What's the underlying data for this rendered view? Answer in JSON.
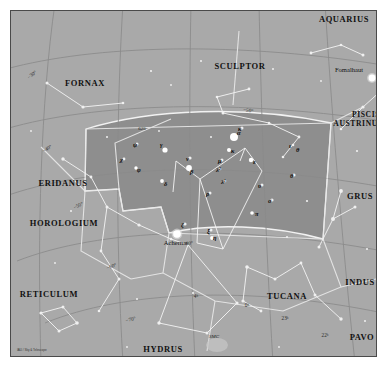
{
  "chart": {
    "type": "star-chart",
    "background_color": "#a9a9a9",
    "highlight_color": "#8e8e8e",
    "border_color": "#4a4a4a",
    "credit": "IAU / Sky & Telescope"
  },
  "constellations": [
    {
      "name": "AQUARIUS",
      "x": 344,
      "y": 22,
      "anchor": "middle",
      "size": "normal"
    },
    {
      "name": "SCULPTOR",
      "x": 240,
      "y": 69,
      "anchor": "middle",
      "size": "normal"
    },
    {
      "name": "FORNAX",
      "x": 85,
      "y": 86,
      "anchor": "middle",
      "size": "normal"
    },
    {
      "name": "PISCIS",
      "x": 366,
      "y": 117,
      "anchor": "middle",
      "size": "small"
    },
    {
      "name": "AUSTRINUS",
      "x": 358,
      "y": 126,
      "anchor": "middle",
      "size": "small"
    },
    {
      "name": "ERIDANUS",
      "x": 63,
      "y": 186,
      "anchor": "middle",
      "size": "normal"
    },
    {
      "name": "GRUS",
      "x": 360,
      "y": 199,
      "anchor": "middle",
      "size": "normal"
    },
    {
      "name": "HOROLOGIUM",
      "x": 64,
      "y": 226,
      "anchor": "middle",
      "size": "normal"
    },
    {
      "name": "INDUS",
      "x": 360,
      "y": 285,
      "anchor": "middle",
      "size": "normal"
    },
    {
      "name": "RETICULUM",
      "x": 49,
      "y": 297,
      "anchor": "middle",
      "size": "normal"
    },
    {
      "name": "TUCANA",
      "x": 287,
      "y": 299,
      "anchor": "middle",
      "size": "normal"
    },
    {
      "name": "PAVO",
      "x": 362,
      "y": 340,
      "anchor": "middle",
      "size": "normal"
    },
    {
      "name": "HYDRUS",
      "x": 163,
      "y": 352,
      "anchor": "middle",
      "size": "normal"
    }
  ],
  "named_stars": [
    {
      "name": "Fomalhaut",
      "x": 349,
      "y": 72,
      "dot_x": 372,
      "dot_y": 78,
      "r": 3.4
    },
    {
      "name": "Achernar",
      "x": 176,
      "y": 245,
      "dot_x": 177,
      "dot_y": 234,
      "r": 3.8
    }
  ],
  "deep_sky": [
    {
      "label": "SMC",
      "x": 214,
      "y": 338
    },
    {
      "label": "625",
      "x": 142,
      "y": 130
    }
  ],
  "greek_stars": [
    {
      "g": "γ",
      "x": 160,
      "y": 147,
      "dx": 165,
      "dy": 150,
      "m": 2.6
    },
    {
      "g": "ν",
      "x": 186,
      "y": 161,
      "dx": null,
      "dy": null,
      "m": 1.6
    },
    {
      "g": "β",
      "x": 190,
      "y": 174,
      "dx": 189,
      "dy": 168,
      "m": 2.9
    },
    {
      "g": "δ",
      "x": 164,
      "y": 186,
      "dx": 162,
      "dy": 181,
      "m": 1.9
    },
    {
      "g": "ψ",
      "x": 133,
      "y": 147,
      "dx": null,
      "dy": null,
      "m": 1.5
    },
    {
      "g": "χ",
      "x": 120,
      "y": 162,
      "dx": null,
      "dy": null,
      "m": 1.4
    },
    {
      "g": "φ",
      "x": 137,
      "y": 172,
      "dx": 136,
      "dy": 168,
      "m": 1.7
    },
    {
      "g": "κ",
      "x": 238,
      "y": 131,
      "dx": null,
      "dy": null,
      "m": 1.5
    },
    {
      "g": "α",
      "x": 237,
      "y": 135,
      "dx": 234,
      "dy": 137,
      "m": 4.0
    },
    {
      "g": "κ",
      "x": 231,
      "y": 153,
      "dx": 229,
      "dy": 150,
      "m": 2.0
    },
    {
      "g": "μ",
      "x": 218,
      "y": 163,
      "dx": null,
      "dy": null,
      "m": 1.5
    },
    {
      "g": "λ²",
      "x": 216,
      "y": 172,
      "dx": null,
      "dy": null,
      "m": 1.3
    },
    {
      "g": "λ¹",
      "x": 221,
      "y": 184,
      "dx": null,
      "dy": null,
      "m": 1.3
    },
    {
      "g": "ε",
      "x": 253,
      "y": 164,
      "dx": 251,
      "dy": 160,
      "m": 2.2
    },
    {
      "g": "ι",
      "x": 289,
      "y": 148,
      "dx": null,
      "dy": null,
      "m": 1.3
    },
    {
      "g": "θ",
      "x": 290,
      "y": 178,
      "dx": null,
      "dy": null,
      "m": 1.6
    },
    {
      "g": "υ",
      "x": 258,
      "y": 188,
      "dx": null,
      "dy": null,
      "m": 1.5
    },
    {
      "g": "ρ",
      "x": 206,
      "y": 196,
      "dx": null,
      "dy": null,
      "m": 1.5
    },
    {
      "g": "σ",
      "x": 268,
      "y": 203,
      "dx": null,
      "dy": null,
      "m": 1.6
    },
    {
      "g": "π",
      "x": 255,
      "y": 216,
      "dx": 252,
      "dy": 213,
      "m": 1.8
    },
    {
      "g": "ζ",
      "x": 181,
      "y": 227,
      "dx": null,
      "dy": null,
      "m": 1.6
    },
    {
      "g": "ξ",
      "x": 207,
      "y": 233,
      "dx": null,
      "dy": null,
      "m": 1.5
    },
    {
      "g": "η",
      "x": 213,
      "y": 240,
      "dx": 212,
      "dy": 238,
      "m": 1.9
    },
    {
      "g": "θ",
      "x": 296,
      "y": 152,
      "dx": null,
      "dy": null,
      "m": 0
    }
  ],
  "grid_labels": [
    {
      "text": "−30°",
      "x": 33,
      "y": 76,
      "rot": -38
    },
    {
      "text": "−40°",
      "x": 48,
      "y": 150,
      "rot": -32
    },
    {
      "text": "−50°",
      "x": 79,
      "y": 207,
      "rot": -26
    },
    {
      "text": "−60°",
      "x": 112,
      "y": 268,
      "rot": -20
    },
    {
      "text": "−70°",
      "x": 131,
      "y": 321,
      "rot": -14
    },
    {
      "text": "−60°",
      "x": 188,
      "y": 245,
      "rot": -4
    },
    {
      "text": "−50°",
      "x": 248,
      "y": 112,
      "rot": 8
    },
    {
      "text": "4ʰ",
      "x": 196,
      "y": 298,
      "rot": 0
    },
    {
      "text": "0ʰ",
      "x": 247,
      "y": 307,
      "rot": 0
    },
    {
      "text": "23ʰ",
      "x": 285,
      "y": 320,
      "rot": 0
    },
    {
      "text": "22ʰ",
      "x": 325,
      "y": 337,
      "rot": 0
    }
  ]
}
